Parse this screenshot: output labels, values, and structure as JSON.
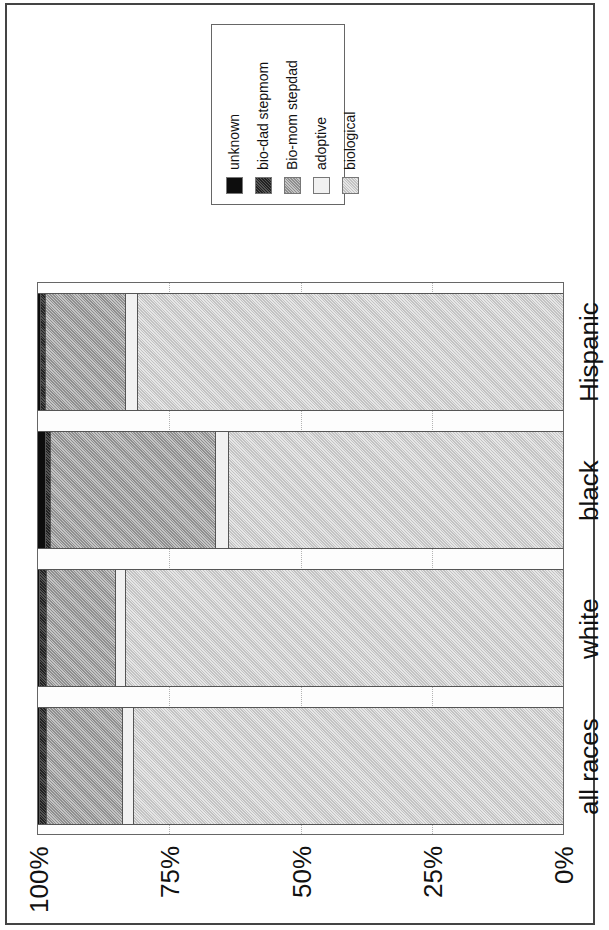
{
  "chart_data": {
    "type": "bar",
    "orientation": "stacked-horizontal (figure rotated 90 degrees)",
    "title": "",
    "xlabel": "",
    "ylabel": "",
    "ylim": [
      0,
      100
    ],
    "grid": true,
    "legend_position": "top-left (rotated)",
    "categories": [
      "all races",
      "white",
      "black",
      "Hispanic"
    ],
    "tick_labels": [
      "100%",
      "75%",
      "50%",
      "25%",
      "0%"
    ],
    "series": [
      {
        "name": "unknown",
        "values": [
          0.4,
          0.4,
          1.5,
          0.6
        ]
      },
      {
        "name": "bio-dad stepmom",
        "values": [
          1.3,
          1.3,
          1.0,
          1.0
        ]
      },
      {
        "name": "Bio-mom stepdad",
        "values": [
          14.5,
          13.2,
          31.4,
          15.2
        ]
      },
      {
        "name": "adoptive",
        "values": [
          2.1,
          1.9,
          2.5,
          2.3
        ]
      },
      {
        "name": "biological",
        "values": [
          81.7,
          83.2,
          63.6,
          80.9
        ]
      }
    ]
  },
  "legend": {
    "items": [
      {
        "label": "unknown",
        "pattern": "unknown"
      },
      {
        "label": "bio-dad stepmom",
        "pattern": "biodad"
      },
      {
        "label": "Bio-mom stepdad",
        "pattern": "biomom"
      },
      {
        "label": "adoptive",
        "pattern": "adoptive"
      },
      {
        "label": "biological",
        "pattern": "biological"
      }
    ]
  },
  "axis": {
    "ticks": [
      "100%",
      "75%",
      "50%",
      "25%",
      "0%"
    ]
  }
}
